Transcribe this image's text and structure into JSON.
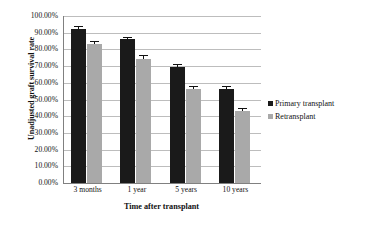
{
  "chart_data": {
    "type": "bar",
    "title": "",
    "xlabel": "Time after transplant",
    "ylabel": "Unadjusted graft survival rate",
    "categories": [
      "3 months",
      "1 year",
      "5 years",
      "10 years"
    ],
    "series": [
      {
        "name": "Primary transplant",
        "color": "#1a1a1a",
        "values": [
          92.5,
          86.0,
          69.7,
          56.5
        ]
      },
      {
        "name": "Retransplant",
        "color": "#a9a9a9",
        "values": [
          83.0,
          74.5,
          56.0,
          43.0
        ]
      }
    ],
    "error_bars": {
      "Primary transplant": [
        1.0,
        0.8,
        0.8,
        0.8
      ],
      "Retransplant": [
        1.5,
        1.5,
        1.2,
        1.2
      ]
    },
    "ylim": [
      0,
      100
    ],
    "ytick_values": [
      0,
      10,
      20,
      30,
      40,
      50,
      60,
      70,
      80,
      90,
      100
    ],
    "ytick_labels": [
      "0.00%",
      "10.00%",
      "20.00%",
      "30.00%",
      "40.00%",
      "50.00%",
      "60.00%",
      "70.00%",
      "80.00%",
      "90.00%",
      "100.00%"
    ],
    "grid": true,
    "legend_position": "right"
  },
  "legend": {
    "entries": [
      {
        "label": "Primary transplant",
        "color": "#1a1a1a"
      },
      {
        "label": "Retransplant",
        "color": "#a9a9a9"
      }
    ]
  }
}
